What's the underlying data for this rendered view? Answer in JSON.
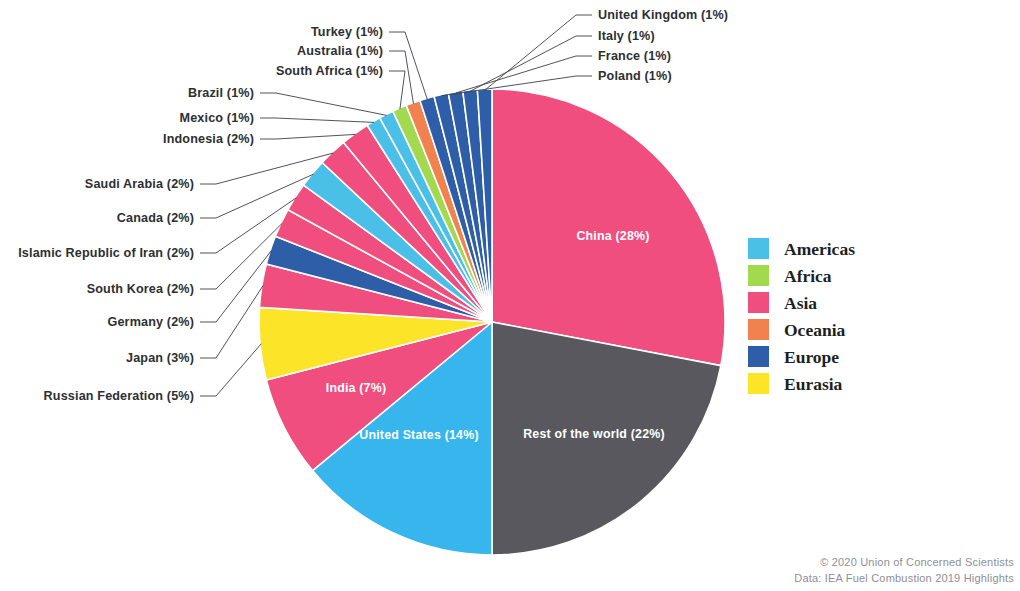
{
  "chart_data": {
    "type": "pie",
    "title": "",
    "unit": "percent",
    "center": {
      "x": 492,
      "y": 322
    },
    "radius": 233,
    "start_angle_deg": -90,
    "direction": "clockwise",
    "legend": {
      "position": "right",
      "entries": [
        {
          "label": "Americas",
          "color": "#4ac0e8"
        },
        {
          "label": "Africa",
          "color": "#a3d94f"
        },
        {
          "label": "Asia",
          "color": "#ef4e7f"
        },
        {
          "label": "Oceania",
          "color": "#f28150"
        },
        {
          "label": "Europe",
          "color": "#2e5ea8"
        },
        {
          "label": "Eurasia",
          "color": "#fce429"
        }
      ]
    },
    "categories": [
      "China",
      "Rest of the world",
      "United States",
      "India",
      "Russian Federation",
      "Japan",
      "Germany",
      "South Korea",
      "Islamic Republic of Iran",
      "Canada",
      "Saudi Arabia",
      "Indonesia",
      "Mexico",
      "Brazil",
      "South Africa",
      "Australia",
      "Turkey",
      "Poland",
      "France",
      "Italy",
      "United Kingdom"
    ],
    "values": [
      28,
      22,
      14,
      7,
      5,
      3,
      2,
      2,
      2,
      2,
      2,
      2,
      1,
      1,
      1,
      1,
      1,
      1,
      1,
      1,
      1
    ],
    "slices": [
      {
        "name": "China",
        "percent": 28,
        "label": "China (28%)",
        "region": "Asia",
        "color": "#ef4e7f",
        "label_mode": "inside",
        "label_x": 613,
        "label_y": 240
      },
      {
        "name": "Rest of the world",
        "percent": 22,
        "label": "Rest of the world (22%)",
        "region": "Other",
        "color": "#58585e",
        "label_mode": "inside",
        "label_x": 594,
        "label_y": 438
      },
      {
        "name": "United States",
        "percent": 14,
        "label": "United States (14%)",
        "region": "Americas",
        "color": "#36b6ed",
        "label_mode": "inside",
        "label_x": 419,
        "label_y": 439
      },
      {
        "name": "India",
        "percent": 7,
        "label": "India (7%)",
        "region": "Asia",
        "color": "#ef4e7f",
        "label_mode": "inside",
        "label_x": 356,
        "label_y": 392
      },
      {
        "name": "Russian Federation",
        "percent": 5,
        "label": "Russian Federation (5%)",
        "region": "Eurasia",
        "color": "#fce429",
        "label_mode": "leader",
        "label_x": 194,
        "label_y": 396,
        "anchor": "end"
      },
      {
        "name": "Japan",
        "percent": 3,
        "label": "Japan (3%)",
        "region": "Asia",
        "color": "#ef4e7f",
        "label_mode": "leader",
        "label_x": 194,
        "label_y": 358,
        "anchor": "end"
      },
      {
        "name": "Germany",
        "percent": 2,
        "label": "Germany (2%)",
        "region": "Europe",
        "color": "#2e5ea8",
        "label_mode": "leader",
        "label_x": 194,
        "label_y": 322,
        "anchor": "end"
      },
      {
        "name": "South Korea",
        "percent": 2,
        "label": "South Korea (2%)",
        "region": "Asia",
        "color": "#ef4e7f",
        "label_mode": "leader",
        "label_x": 194,
        "label_y": 289,
        "anchor": "end"
      },
      {
        "name": "Islamic Republic of Iran",
        "percent": 2,
        "label": "Islamic Republic of Iran (2%)",
        "region": "Asia",
        "color": "#ef4e7f",
        "label_mode": "leader",
        "label_x": 194,
        "label_y": 253,
        "anchor": "end"
      },
      {
        "name": "Canada",
        "percent": 2,
        "label": "Canada (2%)",
        "region": "Americas",
        "color": "#4ac0e8",
        "label_mode": "leader",
        "label_x": 194,
        "label_y": 218,
        "anchor": "end"
      },
      {
        "name": "Saudi Arabia",
        "percent": 2,
        "label": "Saudi Arabia (2%)",
        "region": "Asia",
        "color": "#ef4e7f",
        "label_mode": "leader",
        "label_x": 194,
        "label_y": 184,
        "anchor": "end"
      },
      {
        "name": "Indonesia",
        "percent": 2,
        "label": "Indonesia (2%)",
        "region": "Asia",
        "color": "#ef4e7f",
        "label_mode": "leader",
        "label_x": 254,
        "label_y": 139,
        "anchor": "end"
      },
      {
        "name": "Mexico",
        "percent": 1,
        "label": "Mexico (1%)",
        "region": "Americas",
        "color": "#4ac0e8",
        "label_mode": "leader",
        "label_x": 254,
        "label_y": 118,
        "anchor": "end"
      },
      {
        "name": "Brazil",
        "percent": 1,
        "label": "Brazil (1%)",
        "region": "Americas",
        "color": "#4ac0e8",
        "label_mode": "leader",
        "label_x": 254,
        "label_y": 93,
        "anchor": "end"
      },
      {
        "name": "South Africa",
        "percent": 1,
        "label": "South Africa (1%)",
        "region": "Africa",
        "color": "#a3d94f",
        "label_mode": "leader",
        "label_x": 383,
        "label_y": 71,
        "anchor": "end"
      },
      {
        "name": "Australia",
        "percent": 1,
        "label": "Australia (1%)",
        "region": "Oceania",
        "color": "#f28150",
        "label_mode": "leader",
        "label_x": 383,
        "label_y": 51,
        "anchor": "end"
      },
      {
        "name": "Turkey",
        "percent": 1,
        "label": "Turkey (1%)",
        "region": "Europe",
        "color": "#2e5ea8",
        "label_mode": "leader",
        "label_x": 383,
        "label_y": 32,
        "anchor": "end"
      },
      {
        "name": "Poland",
        "percent": 1,
        "label": "Poland (1%)",
        "region": "Europe",
        "color": "#2e5ea8",
        "label_mode": "leader",
        "label_x": 598,
        "label_y": 76,
        "anchor": "start"
      },
      {
        "name": "France",
        "percent": 1,
        "label": "France (1%)",
        "region": "Europe",
        "color": "#2e5ea8",
        "label_mode": "leader",
        "label_x": 598,
        "label_y": 56,
        "anchor": "start"
      },
      {
        "name": "Italy",
        "percent": 1,
        "label": "Italy (1%)",
        "region": "Europe",
        "color": "#2e5ea8",
        "label_mode": "leader",
        "label_x": 598,
        "label_y": 36,
        "anchor": "start"
      },
      {
        "name": "United Kingdom",
        "percent": 1,
        "label": "United Kingdom (1%)",
        "region": "Europe",
        "color": "#2e5ea8",
        "label_mode": "leader",
        "label_x": 598,
        "label_y": 15,
        "anchor": "start"
      }
    ]
  },
  "credit": {
    "line1": "© 2020 Union of Concerned Scientists",
    "line2": "Data: IEA Fuel Combustion 2019 Highlights"
  }
}
